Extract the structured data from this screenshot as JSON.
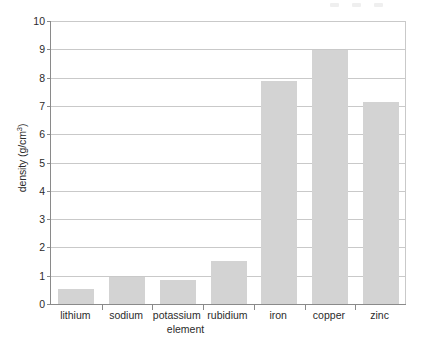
{
  "chart_data": {
    "type": "bar",
    "title": "",
    "subtitle": "",
    "xlabel": "element",
    "ylabel": "density (g/cm3)",
    "ylabel_base": "density (g/cm",
    "ylabel_sup": "3",
    "ylabel_tail": ")",
    "categories": [
      "lithium",
      "sodium",
      "potassium",
      "rubidium",
      "iron",
      "copper",
      "zinc"
    ],
    "values": [
      0.53,
      0.97,
      0.86,
      1.53,
      7.87,
      8.96,
      7.14
    ],
    "series": [
      {
        "name": "density",
        "values": [
          0.53,
          0.97,
          0.86,
          1.53,
          7.87,
          8.96,
          7.14
        ]
      }
    ],
    "ylim": [
      0,
      10
    ],
    "ytick_labels": [
      "0",
      "1",
      "2",
      "3",
      "4",
      "5",
      "6",
      "7",
      "8",
      "9",
      "10"
    ],
    "ytick_values": [
      0,
      1,
      2,
      3,
      4,
      5,
      6,
      7,
      8,
      9,
      10
    ],
    "grid": "horizontal",
    "legend": "none",
    "bar_color": "#d3d3d3",
    "axis_color": "#8a8a8a",
    "grid_color": "#c9c9c9",
    "text_color": "#2b2b2b",
    "background": "#ffffff"
  }
}
